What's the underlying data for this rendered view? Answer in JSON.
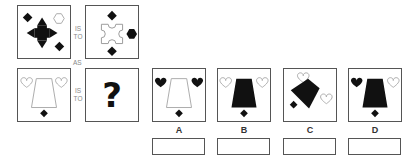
{
  "puzzle": {
    "type": "visual-analogy",
    "connectors": {
      "is_to_line1": "IS",
      "is_to_line2": "TO",
      "as": "AS"
    },
    "question_mark": "?",
    "panels": [
      {
        "id": "premise-1",
        "shapes": [
          "black-cross-arrow",
          "black-diamond-top-left",
          "black-diamond-bottom-right",
          "outline-hexagon-top-right"
        ]
      },
      {
        "id": "premise-2",
        "shapes": [
          "outline-puzzle-square",
          "black-diamond-top",
          "black-diamond-bottom",
          "black-hexagon-right"
        ]
      },
      {
        "id": "premise-3",
        "shapes": [
          "outline-trapezoid",
          "outline-heart-left",
          "outline-heart-right",
          "black-diamond-bottom"
        ]
      },
      {
        "id": "unknown",
        "shapes": [
          "question-mark"
        ]
      }
    ],
    "options": [
      {
        "label": "A",
        "shapes": [
          "outline-trapezoid",
          "black-heart-left",
          "black-heart-right",
          "black-diamond-bottom"
        ]
      },
      {
        "label": "B",
        "shapes": [
          "black-trapezoid",
          "outline-heart-left",
          "outline-heart-right",
          "black-diamond-bottom"
        ]
      },
      {
        "label": "C",
        "shapes": [
          "black-rotated-trapezoid",
          "outline-heart-top",
          "outline-heart-right",
          "black-diamond-left"
        ]
      },
      {
        "label": "D",
        "shapes": [
          "black-trapezoid",
          "black-heart-left",
          "outline-heart-right",
          "black-diamond-bottom"
        ]
      }
    ],
    "answer_boxes": [
      "",
      "",
      "",
      ""
    ]
  },
  "colors": {
    "border": "#555555",
    "fill": "#111111",
    "outline": "#aaaaaa",
    "label": "#888888"
  }
}
